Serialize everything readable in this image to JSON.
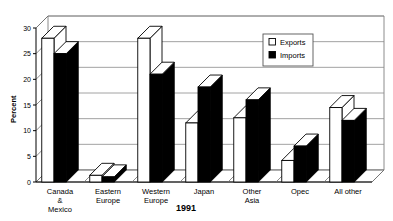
{
  "chart_data": {
    "type": "bar",
    "title": "",
    "xlabel": "1991",
    "ylabel": "Percent",
    "ylim": [
      0,
      30
    ],
    "yticks": [
      0,
      5,
      10,
      15,
      20,
      25,
      30
    ],
    "ytick_labels": [
      "0",
      "5",
      "10",
      "15",
      "20",
      "25",
      "30"
    ],
    "grid": true,
    "legend_position": "upper-right",
    "categories": [
      "Canada & Mexico",
      "Eastern Europe",
      "Western Europe",
      "Japan",
      "Other Asia",
      "Opec",
      "All other"
    ],
    "category_lines": [
      [
        "Canada",
        "&",
        "Mexico"
      ],
      [
        "Eastern",
        "Europe"
      ],
      [
        "Western",
        "Europe"
      ],
      [
        "Japan"
      ],
      [
        "Other",
        "Asia"
      ],
      [
        "Opec"
      ],
      [
        "All other"
      ]
    ],
    "series": [
      {
        "name": "Exports",
        "color": "#ffffff",
        "values": [
          28.0,
          1.3,
          28.0,
          11.5,
          12.5,
          4.2,
          14.5
        ]
      },
      {
        "name": "Imports",
        "color": "#000000",
        "values": [
          25.0,
          1.0,
          21.0,
          18.5,
          16.0,
          7.0,
          12.0
        ]
      }
    ]
  },
  "legend": {
    "items": [
      {
        "label": "Exports",
        "swatch": "hollow-square"
      },
      {
        "label": "Imports",
        "swatch": "filled-square"
      }
    ]
  },
  "axes": {
    "y_title": "Percent",
    "x_title": "1991"
  }
}
